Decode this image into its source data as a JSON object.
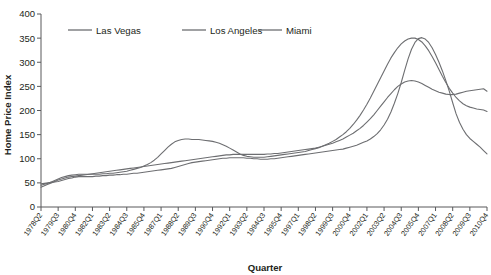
{
  "chart_data": {
    "type": "line",
    "title": "",
    "xlabel": "Quarter",
    "ylabel": "Home Price Index",
    "ylim": [
      0,
      400
    ],
    "yticks": [
      0,
      50,
      100,
      150,
      200,
      250,
      300,
      350,
      400
    ],
    "grid": false,
    "legend_position": "top",
    "legend": [
      "Las Vegas",
      "Los Angeles",
      "Miami"
    ],
    "tick_labels": [
      "1978Q2",
      "1979Q3",
      "1980Q4",
      "1982Q1",
      "1983Q2",
      "1984Q3",
      "1985Q4",
      "1987Q1",
      "1988Q2",
      "1989Q3",
      "1990Q4",
      "1992Q1",
      "1993Q2",
      "1994Q3",
      "1995Q4",
      "1997Q1",
      "1998Q2",
      "1999Q3",
      "2000Q4",
      "2002Q1",
      "2003Q2",
      "2004Q3",
      "2005Q4",
      "2007Q1",
      "2008Q2",
      "2009Q3",
      "2010Q4"
    ],
    "x_start": "1978Q2",
    "x_end": "2010Q4",
    "n_points": 131,
    "series": [
      {
        "name": "Las Vegas",
        "color": "#6d6e71",
        "values": [
          48,
          49,
          50,
          51,
          52,
          53,
          55,
          57,
          59,
          60,
          62,
          63,
          63,
          63,
          63,
          63,
          64,
          64,
          65,
          65,
          66,
          66,
          67,
          67,
          68,
          68,
          69,
          70,
          70,
          71,
          72,
          73,
          74,
          75,
          76,
          77,
          78,
          79,
          80,
          82,
          84,
          86,
          88,
          90,
          92,
          93,
          94,
          95,
          96,
          97,
          98,
          99,
          100,
          101,
          101,
          102,
          102,
          102,
          102,
          102,
          101,
          101,
          100,
          100,
          99,
          99,
          99,
          100,
          100,
          101,
          102,
          103,
          104,
          105,
          106,
          107,
          108,
          109,
          110,
          111,
          112,
          113,
          114,
          115,
          116,
          117,
          118,
          119,
          120,
          122,
          124,
          126,
          128,
          131,
          134,
          137,
          141,
          146,
          152,
          160,
          170,
          182,
          197,
          215,
          235,
          258,
          283,
          307,
          327,
          341,
          349,
          351,
          348,
          341,
          330,
          316,
          300,
          282,
          262,
          240,
          216,
          193,
          175,
          161,
          150,
          142,
          136,
          130,
          124,
          117,
          110
        ]
      },
      {
        "name": "Los Angeles",
        "color": "#6d6e71",
        "values": [
          45,
          47,
          49,
          52,
          55,
          58,
          61,
          63,
          65,
          66,
          67,
          68,
          68,
          68,
          68,
          68,
          68,
          68,
          69,
          69,
          70,
          70,
          71,
          72,
          73,
          74,
          76,
          78,
          80,
          82,
          85,
          88,
          92,
          97,
          103,
          110,
          117,
          124,
          130,
          135,
          138,
          140,
          141,
          141,
          140,
          140,
          140,
          139,
          138,
          137,
          136,
          134,
          132,
          129,
          126,
          122,
          118,
          114,
          110,
          107,
          105,
          104,
          103,
          103,
          103,
          103,
          104,
          105,
          106,
          107,
          108,
          109,
          110,
          111,
          112,
          113,
          114,
          115,
          117,
          119,
          121,
          123,
          126,
          129,
          132,
          136,
          140,
          145,
          150,
          156,
          163,
          171,
          180,
          190,
          201,
          213,
          226,
          240,
          254,
          268,
          282,
          296,
          309,
          320,
          330,
          338,
          344,
          348,
          350,
          350,
          347,
          342,
          334,
          324,
          312,
          299,
          285,
          271,
          258,
          246,
          236,
          227,
          220,
          214,
          210,
          207,
          205,
          203,
          202,
          201,
          198
        ]
      },
      {
        "name": "Miami",
        "color": "#6d6e71",
        "values": [
          41,
          44,
          47,
          50,
          53,
          56,
          58,
          60,
          62,
          63,
          64,
          65,
          66,
          67,
          68,
          69,
          70,
          71,
          72,
          73,
          74,
          75,
          76,
          77,
          78,
          79,
          80,
          81,
          82,
          83,
          84,
          85,
          86,
          87,
          88,
          89,
          90,
          91,
          92,
          93,
          94,
          95,
          96,
          97,
          98,
          99,
          100,
          101,
          102,
          103,
          104,
          105,
          106,
          107,
          108,
          108,
          109,
          109,
          109,
          109,
          109,
          109,
          109,
          109,
          109,
          109,
          110,
          110,
          111,
          111,
          112,
          113,
          114,
          115,
          116,
          117,
          118,
          119,
          120,
          121,
          122,
          124,
          126,
          128,
          130,
          132,
          135,
          138,
          141,
          145,
          149,
          153,
          158,
          163,
          169,
          176,
          183,
          191,
          200,
          209,
          218,
          227,
          235,
          243,
          250,
          255,
          259,
          261,
          262,
          261,
          259,
          256,
          252,
          248,
          244,
          241,
          238,
          236,
          234,
          233,
          233,
          234,
          236,
          238,
          240,
          241,
          242,
          243,
          244,
          245,
          240
        ]
      }
    ]
  }
}
